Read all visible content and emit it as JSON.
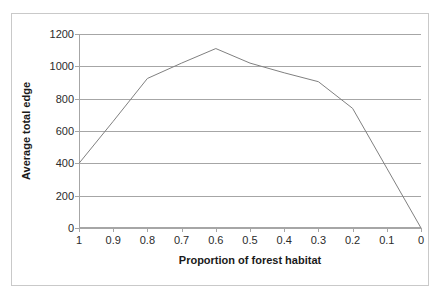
{
  "chart_data": {
    "type": "line",
    "title": "",
    "xlabel": "Proportion of forest habitat",
    "ylabel": "Average total edge",
    "categories": [
      "1",
      "0.9",
      "0.8",
      "0.7",
      "0.6",
      "0.5",
      "0.4",
      "0.3",
      "0.2",
      "0.1",
      "0"
    ],
    "values": [
      400,
      660,
      925,
      1020,
      1110,
      1020,
      960,
      905,
      740,
      370,
      0
    ],
    "ylim": [
      0,
      1200
    ],
    "ytick_labels": [
      "1200",
      "1000",
      "800",
      "600",
      "400",
      "200",
      "0"
    ],
    "ytick_values": [
      1200,
      1000,
      800,
      600,
      400,
      200,
      0
    ],
    "ytick_step": 200,
    "grid": "horizontal",
    "legend": "none",
    "series_color": "#808080",
    "gridline_color": "#a6a6a6",
    "axis_color": "#a6a6a6",
    "plot_background": "#ffffff",
    "frame_border_color": "#c9c9c9",
    "series": [
      {
        "name": "Average total edge",
        "values": [
          400,
          660,
          925,
          1020,
          1110,
          1020,
          960,
          905,
          740,
          370,
          0
        ]
      }
    ]
  }
}
